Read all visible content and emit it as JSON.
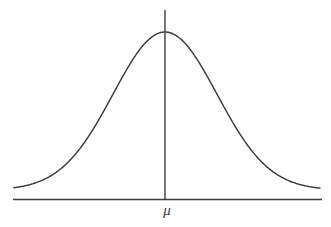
{
  "figure": {
    "background_color": "#ffffff",
    "line_color": "#3b3b3b",
    "width": 331,
    "height": 227
  },
  "labels": {
    "mean_symbol": "μ"
  },
  "axes": {
    "baseline": {
      "name": "horizontal-axis",
      "x_start": 13,
      "x_end": 322,
      "y": 199.5
    },
    "center_line": {
      "name": "vertical-axis-at-mean",
      "x": 165,
      "y_top": 10,
      "y_bottom": 199.5
    }
  },
  "chart_data": {
    "type": "line",
    "title": "",
    "subtitle": "",
    "xlabel": "",
    "ylabel": "",
    "grid": false,
    "legend_position": "none",
    "annotations": [
      {
        "text": "μ",
        "x": 165,
        "y": 210,
        "描述": "mean marker below the vertical axis"
      }
    ],
    "curve": {
      "name": "gaussian-probability-density",
      "mean_px": 165,
      "peak_y_px": 32,
      "baseline_y_px": 199.5,
      "sigma_px": 52,
      "x_start_px": 14,
      "x_end_px": 320,
      "tail_y_px": 190
    },
    "x": [
      14,
      24,
      34,
      44,
      54,
      64,
      74,
      84,
      94,
      104,
      114,
      124,
      134,
      144,
      154,
      165,
      176,
      186,
      196,
      206,
      216,
      226,
      236,
      246,
      256,
      266,
      276,
      286,
      296,
      306,
      316,
      320
    ],
    "y": [
      190.1,
      189.4,
      188.2,
      186.3,
      183.4,
      179.0,
      172.8,
      164.4,
      153.6,
      140.3,
      124.9,
      108.0,
      90.7,
      74.4,
      60.5,
      50.3,
      44.7,
      44.2,
      48.2,
      56.4,
      68.1,
      82.3,
      97.7,
      113.2,
      127.6,
      140.1,
      150.5,
      158.6,
      164.8,
      169.3,
      172.5,
      173.4
    ],
    "xlim": [
      0,
      331
    ],
    "ylim": [
      0,
      227
    ],
    "note": "y values are pixel coordinates of the drawn gaussian; the rendered path uses the analytic gaussian defined in curve{}"
  }
}
